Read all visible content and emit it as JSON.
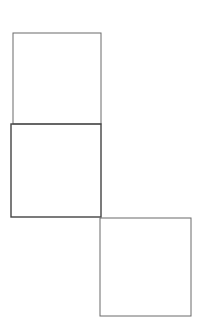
{
  "diagram": {
    "background": "#ffffff",
    "stroke_color": "#5a5a5a",
    "shapes": [
      {
        "name": "top-square",
        "x": 13,
        "y": 33,
        "w": 88,
        "h": 91,
        "stroke": "#6a6a6a",
        "stroke_width": 1
      },
      {
        "name": "middle-square",
        "x": 11,
        "y": 124,
        "w": 90,
        "h": 93,
        "stroke": "#444444",
        "stroke_width": 1.4
      },
      {
        "name": "bottom-right-square",
        "x": 100,
        "y": 218,
        "w": 91,
        "h": 98,
        "stroke": "#6a6a6a",
        "stroke_width": 1
      }
    ]
  }
}
